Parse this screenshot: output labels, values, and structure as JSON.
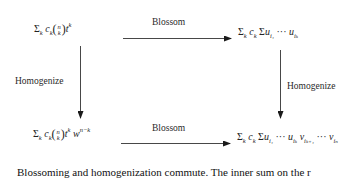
{
  "diagram": {
    "type": "commutative-diagram",
    "nodes": {
      "top_left": {
        "sum": "Σ",
        "sum_sub": "k",
        "coef": "c",
        "coef_sub": "k",
        "binom_top": "n",
        "binom_bottom": "k",
        "var": "t",
        "var_sup": "k"
      },
      "top_right": {
        "sum": "Σ",
        "sum_sub": "k",
        "coef": "c",
        "coef_sub": "k",
        "inner_sum": "Σ",
        "u1": "u",
        "u1_sub": "i₁",
        "dots": "···",
        "uk": "u",
        "uk_sub": "iₖ"
      },
      "bottom_left": {
        "sum": "Σ",
        "sum_sub": "k",
        "coef": "c",
        "coef_sub": "k",
        "binom_top": "n",
        "binom_bottom": "k",
        "var": "t",
        "var_sup": "k",
        "w": "w",
        "w_sup": "n−k"
      },
      "bottom_right": {
        "sum": "Σ",
        "sum_sub": "k",
        "coef": "c",
        "coef_sub": "k",
        "inner_sum": "Σ",
        "u1": "u",
        "u1_sub": "i₁",
        "dots1": "···",
        "uk": "u",
        "uk_sub": "iₖ",
        "v1": "v",
        "v1_sub": "iₖ₊₁",
        "dots2": "···",
        "vn": "v",
        "vn_sub": "iₙ"
      }
    },
    "edges": {
      "top": {
        "label": "Blossom",
        "from": "top_left",
        "to": "top_right"
      },
      "left": {
        "label": "Homogenize",
        "from": "top_left",
        "to": "bottom_left"
      },
      "right": {
        "label": "Homogenize",
        "from": "top_right",
        "to": "bottom_right"
      },
      "bottom": {
        "label": "Blossom",
        "from": "bottom_left",
        "to": "bottom_right"
      }
    }
  },
  "caption": {
    "text": "Blossoming and homogenization commute. The inner sum on the r"
  }
}
